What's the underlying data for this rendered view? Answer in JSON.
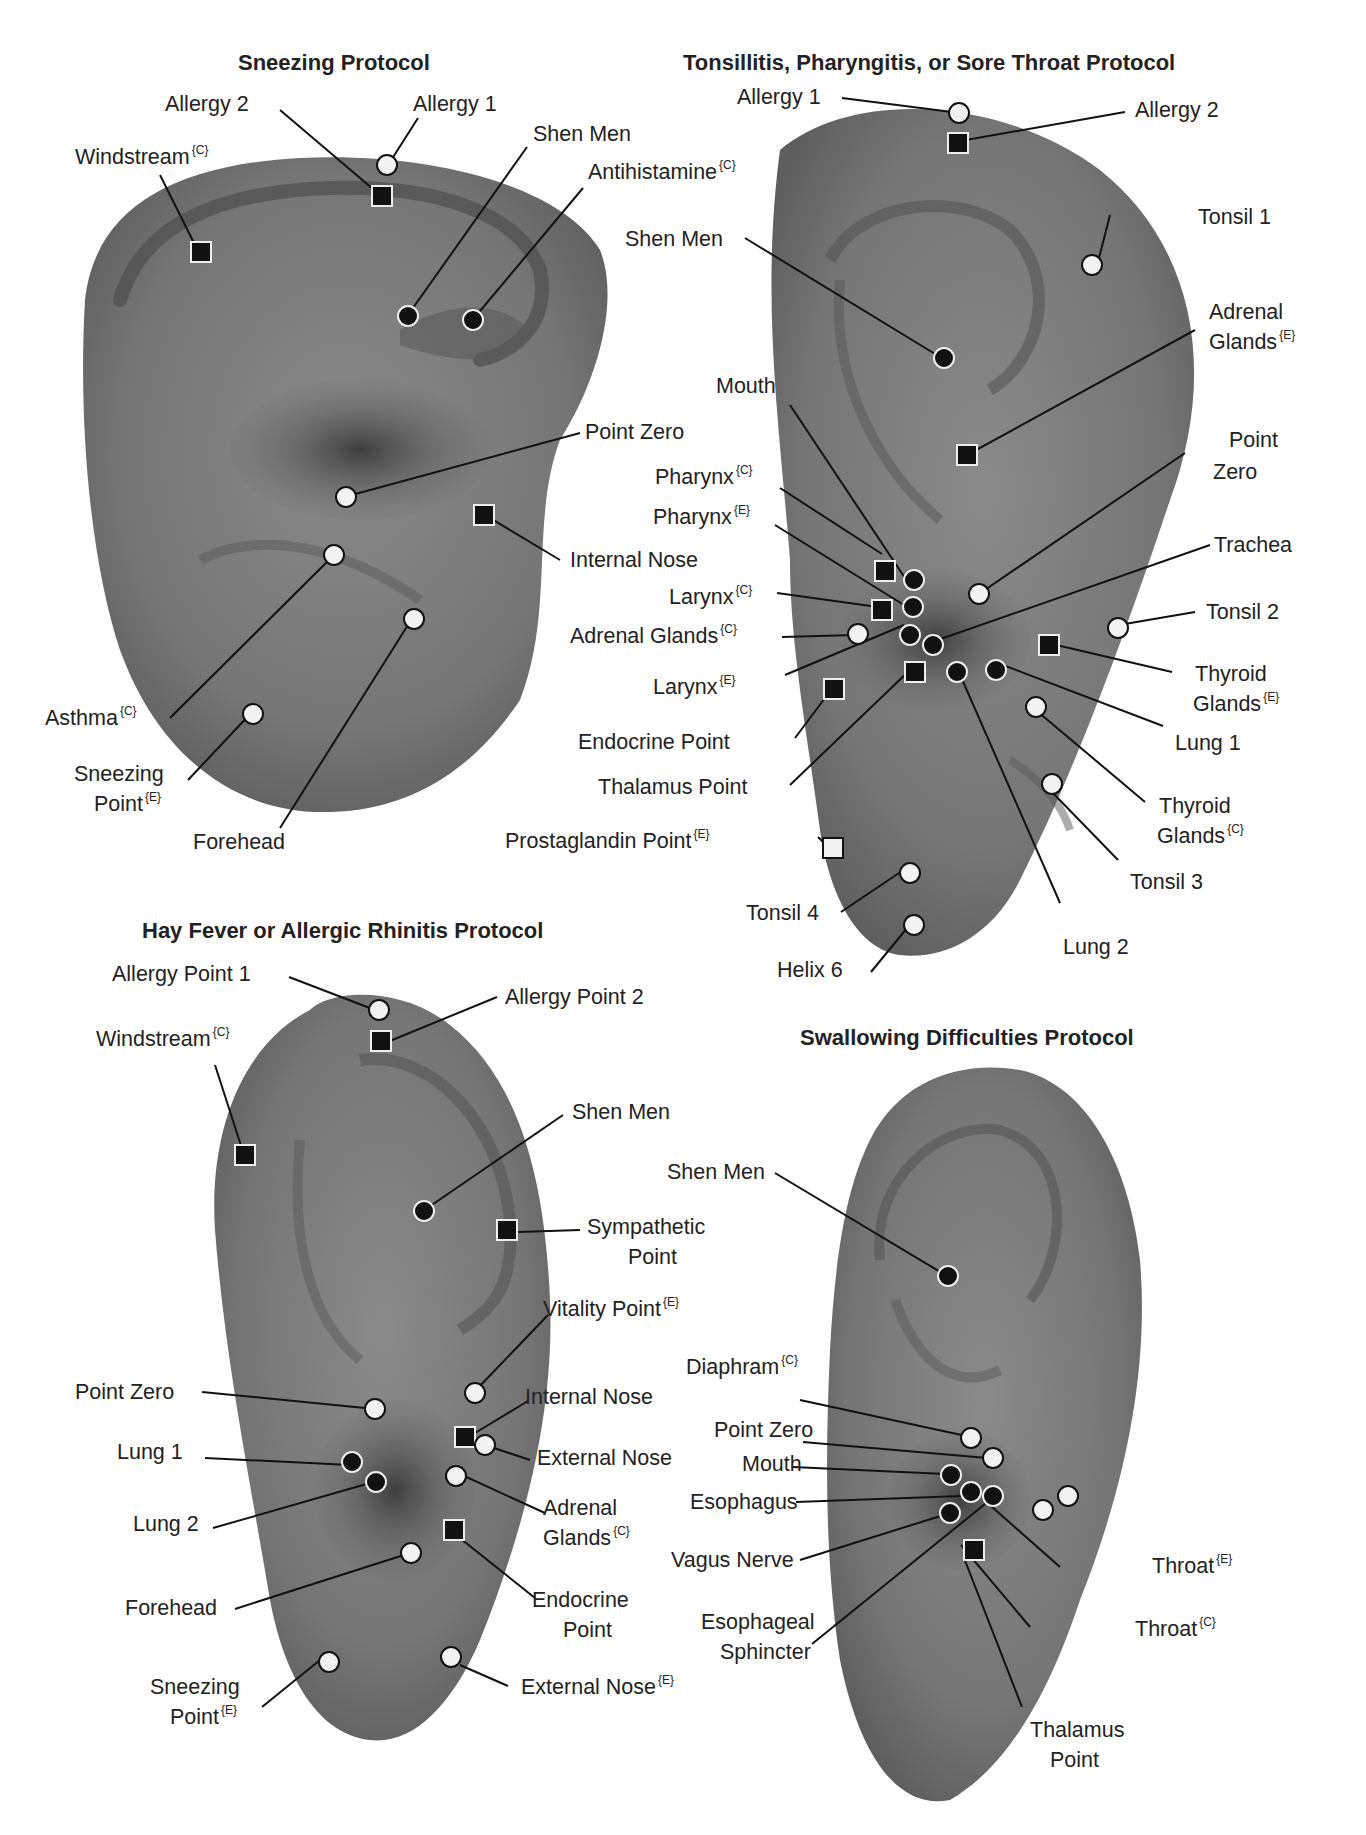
{
  "legend": {
    "marker_types": {
      "white_circle": "point (white circle)",
      "black_circle": "point (black circle)",
      "black_square": "point (black square)",
      "white_square": "point (white square)"
    },
    "superscripts": {
      "C": "{C}",
      "E": "{E}"
    }
  },
  "panels": [
    {
      "title": "Sneezing Protocol",
      "labels": [
        {
          "text": "Allergy 2",
          "sup": ""
        },
        {
          "text": "Allergy 1",
          "sup": ""
        },
        {
          "text": "Shen Men",
          "sup": ""
        },
        {
          "text": "Windstream",
          "sup": "{C}"
        },
        {
          "text": "Antihistamine",
          "sup": "{C}"
        },
        {
          "text": "Point Zero",
          "sup": ""
        },
        {
          "text": "Internal Nose",
          "sup": ""
        },
        {
          "text": "Asthma",
          "sup": "{C}"
        },
        {
          "text": "Sneezing",
          "sup": ""
        },
        {
          "text": "Point",
          "sup": "{E}"
        },
        {
          "text": "Forehead",
          "sup": ""
        }
      ]
    },
    {
      "title": "Tonsillitis, Pharyngitis, or Sore Throat Protocol",
      "labels": [
        {
          "text": "Allergy 1",
          "sup": ""
        },
        {
          "text": "Allergy 2",
          "sup": ""
        },
        {
          "text": "Tonsil 1",
          "sup": ""
        },
        {
          "text": "Shen Men",
          "sup": ""
        },
        {
          "text": "Adrenal",
          "sup": ""
        },
        {
          "text": "Glands",
          "sup": "{E}"
        },
        {
          "text": "Mouth",
          "sup": ""
        },
        {
          "text": "Point",
          "sup": ""
        },
        {
          "text": "Zero",
          "sup": ""
        },
        {
          "text": "Pharynx",
          "sup": "{C}"
        },
        {
          "text": "Pharynx",
          "sup": "{E}"
        },
        {
          "text": "Trachea",
          "sup": ""
        },
        {
          "text": "Larynx",
          "sup": "{C}"
        },
        {
          "text": "Tonsil 2",
          "sup": ""
        },
        {
          "text": "Adrenal Glands",
          "sup": "{C}"
        },
        {
          "text": "Larynx",
          "sup": "{E}"
        },
        {
          "text": "Thyroid",
          "sup": ""
        },
        {
          "text": "Glands",
          "sup": "{E}"
        },
        {
          "text": "Endocrine Point",
          "sup": ""
        },
        {
          "text": "Lung 1",
          "sup": ""
        },
        {
          "text": "Thalamus Point",
          "sup": ""
        },
        {
          "text": "Thyroid",
          "sup": ""
        },
        {
          "text": "Glands",
          "sup": "{C}"
        },
        {
          "text": "Prostaglandin Point",
          "sup": "{E}"
        },
        {
          "text": "Tonsil 3",
          "sup": ""
        },
        {
          "text": "Tonsil 4",
          "sup": ""
        },
        {
          "text": "Lung 2",
          "sup": ""
        },
        {
          "text": "Helix 6",
          "sup": ""
        }
      ]
    },
    {
      "title": "Hay Fever or Allergic Rhinitis Protocol",
      "labels": [
        {
          "text": "Allergy Point 1",
          "sup": ""
        },
        {
          "text": "Allergy Point 2",
          "sup": ""
        },
        {
          "text": "Windstream",
          "sup": "{C}"
        },
        {
          "text": "Shen Men",
          "sup": ""
        },
        {
          "text": "Sympathetic",
          "sup": ""
        },
        {
          "text": "Point",
          "sup": ""
        },
        {
          "text": "Vitality Point",
          "sup": "{E}"
        },
        {
          "text": "Point Zero",
          "sup": ""
        },
        {
          "text": "Internal Nose",
          "sup": ""
        },
        {
          "text": "Lung 1",
          "sup": ""
        },
        {
          "text": "External Nose",
          "sup": ""
        },
        {
          "text": "Lung 2",
          "sup": ""
        },
        {
          "text": "Adrenal",
          "sup": ""
        },
        {
          "text": "Glands",
          "sup": "{C}"
        },
        {
          "text": "Forehead",
          "sup": ""
        },
        {
          "text": "Endocrine",
          "sup": ""
        },
        {
          "text": "Point",
          "sup": ""
        },
        {
          "text": "Sneezing",
          "sup": ""
        },
        {
          "text": "Point",
          "sup": "{E}"
        },
        {
          "text": "External Nose",
          "sup": "{E}"
        }
      ]
    },
    {
      "title": "Swallowing Difficulties Protocol",
      "labels": [
        {
          "text": "Shen Men",
          "sup": ""
        },
        {
          "text": "Diaphram",
          "sup": "{C}"
        },
        {
          "text": "Point Zero",
          "sup": ""
        },
        {
          "text": "Mouth",
          "sup": ""
        },
        {
          "text": "Esophagus",
          "sup": ""
        },
        {
          "text": "Vagus Nerve",
          "sup": ""
        },
        {
          "text": "Throat",
          "sup": "{E}"
        },
        {
          "text": "Esophageal",
          "sup": ""
        },
        {
          "text": "Sphincter",
          "sup": ""
        },
        {
          "text": "Throat",
          "sup": "{C}"
        },
        {
          "text": "Thalamus",
          "sup": ""
        },
        {
          "text": "Point",
          "sup": ""
        }
      ]
    }
  ],
  "colors": {
    "ear_fill": "#7a7a7a",
    "ear_dark": "#4a4a4a",
    "ear_light": "#9a9a9a",
    "marker_dark": "#111111",
    "marker_light": "#f2f2f2",
    "text": "#222222",
    "background": "#ffffff"
  }
}
